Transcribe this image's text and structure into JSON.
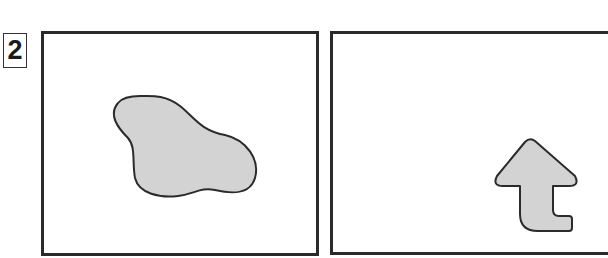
{
  "figure": {
    "label": "2",
    "panels": [
      {
        "name": "left",
        "shape": "irregular-blob",
        "fill": "#d3d3d3",
        "stroke": "#2b2b2b"
      },
      {
        "name": "right",
        "shape": "arrow-up-with-hook",
        "fill": "#d3d3d3",
        "stroke": "#2b2b2b"
      }
    ]
  }
}
